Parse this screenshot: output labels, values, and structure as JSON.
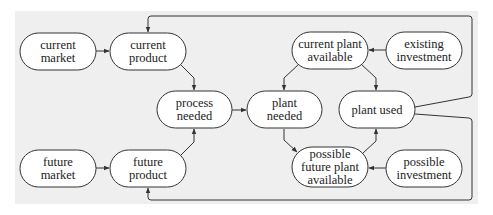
{
  "diagram": {
    "background": "#efefef",
    "node_fill": "#ffffff",
    "stroke": "#333333",
    "nodes": [
      {
        "id": "current_market",
        "lines": [
          "current",
          "market"
        ],
        "x": 20,
        "y": 33,
        "w": 76,
        "h": 37
      },
      {
        "id": "current_product",
        "lines": [
          "current",
          "product"
        ],
        "x": 110,
        "y": 33,
        "w": 76,
        "h": 37
      },
      {
        "id": "current_plant_available",
        "lines": [
          "current plant",
          "available"
        ],
        "x": 292,
        "y": 32,
        "w": 76,
        "h": 37
      },
      {
        "id": "existing_investment",
        "lines": [
          "existing",
          "investment"
        ],
        "x": 386,
        "y": 32,
        "w": 76,
        "h": 37
      },
      {
        "id": "process_needed",
        "lines": [
          "process",
          "needed"
        ],
        "x": 157,
        "y": 91,
        "w": 75,
        "h": 37
      },
      {
        "id": "plant_needed",
        "lines": [
          "plant",
          "needed"
        ],
        "x": 247,
        "y": 91,
        "w": 75,
        "h": 37
      },
      {
        "id": "plant_used",
        "lines": [
          "plant used"
        ],
        "x": 339,
        "y": 91,
        "w": 76,
        "h": 37
      },
      {
        "id": "future_market",
        "lines": [
          "future",
          "market"
        ],
        "x": 20,
        "y": 150,
        "w": 76,
        "h": 37
      },
      {
        "id": "future_product",
        "lines": [
          "future",
          "product"
        ],
        "x": 110,
        "y": 150,
        "w": 76,
        "h": 37
      },
      {
        "id": "possible_future_plant_available",
        "lines": [
          "possible",
          "future plant",
          "available"
        ],
        "x": 292,
        "y": 147,
        "w": 76,
        "h": 40
      },
      {
        "id": "possible_investment",
        "lines": [
          "possible",
          "investment"
        ],
        "x": 386,
        "y": 150,
        "w": 76,
        "h": 37
      }
    ],
    "edges": [
      {
        "from": "current_market",
        "to": "current_product"
      },
      {
        "from": "future_market",
        "to": "future_product"
      },
      {
        "from": "current_product",
        "to": "process_needed"
      },
      {
        "from": "future_product",
        "to": "process_needed"
      },
      {
        "from": "process_needed",
        "to": "plant_needed"
      },
      {
        "from": "existing_investment",
        "to": "current_plant_available"
      },
      {
        "from": "possible_investment",
        "to": "possible_future_plant_available"
      },
      {
        "from": "current_plant_available",
        "to": "plant_needed"
      },
      {
        "from": "current_plant_available",
        "to": "plant_used"
      },
      {
        "from": "plant_needed",
        "to": "possible_future_plant_available"
      },
      {
        "from": "possible_future_plant_available",
        "to": "plant_used"
      },
      {
        "from": "plant_used",
        "to": "current_product",
        "note": "feedback loop via top"
      },
      {
        "from": "plant_used",
        "to": "future_product",
        "note": "feedback loop via bottom"
      }
    ]
  }
}
